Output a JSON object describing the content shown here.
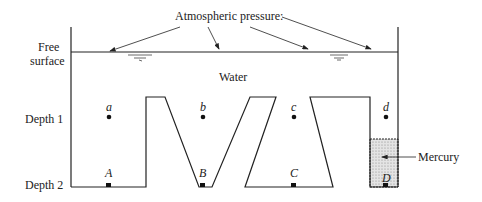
{
  "title_label": "Atmospheric pressure:",
  "free_surface": {
    "line1": "Free",
    "line2": "surface"
  },
  "fluid_label": "Water",
  "depth_labels": [
    "Depth 1",
    "Depth 2"
  ],
  "mercury_label": "Mercury",
  "points_depth1": [
    "a",
    "b",
    "c",
    "d"
  ],
  "points_depth2": [
    "A",
    "B",
    "C",
    "D"
  ],
  "colors": {
    "line": "#222222",
    "mercury_fill": "#d9d9d9"
  }
}
